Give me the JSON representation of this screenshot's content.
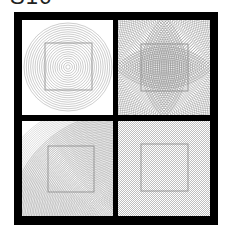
{
  "title": "S16",
  "frame": {
    "color": "#000000"
  },
  "panels": [
    {
      "id": "top-left",
      "pattern": "concentric-circles-centered",
      "line_color": "#9a9a9a",
      "inner_square": true
    },
    {
      "id": "top-right",
      "pattern": "concentric-circles-from-edge-midpoints",
      "line_color": "#8a8a8a",
      "inner_square": true
    },
    {
      "id": "bottom-left",
      "pattern": "dense-circles-offset-moire",
      "line_color": "#a0a0a0",
      "inner_square": true
    },
    {
      "id": "bottom-right",
      "pattern": "crosshatch-moire",
      "line_color": "#a8a8a8",
      "inner_square": true
    }
  ]
}
